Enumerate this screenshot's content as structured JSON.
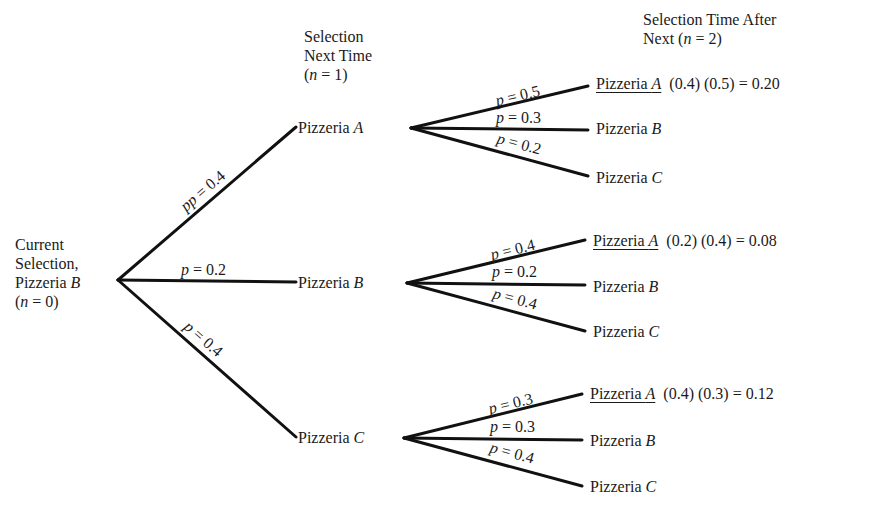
{
  "headers": {
    "current": {
      "line1": "Current",
      "line2": "Selection,",
      "line3_prefix": "Pizzeria ",
      "line3_var": "B",
      "line4": "(n = 0)"
    },
    "level1": {
      "line1": "Selection",
      "line2": "Next Time",
      "line3": "(n = 1)"
    },
    "level2": {
      "line1": "Selection Time After",
      "line2": "Next (n = 2)"
    }
  },
  "root": {
    "label": "Current Selection, Pizzeria B",
    "n": 0
  },
  "level1_branches": [
    {
      "prob_label": "p = 0.4",
      "node_prefix": "Pizzeria ",
      "node_var": "A"
    },
    {
      "prob_label": "p = 0.2",
      "node_prefix": "Pizzeria ",
      "node_var": "B"
    },
    {
      "prob_label": "p = 0.4",
      "node_prefix": "Pizzeria ",
      "node_var": "C"
    }
  ],
  "level2_groups": [
    {
      "parent": "Pizzeria A",
      "branches": [
        {
          "prob_label": "p = 0.5",
          "node_prefix": "Pizzeria ",
          "node_var": "A",
          "calc": "(0.4) (0.5) = 0.20"
        },
        {
          "prob_label": "p = 0.3",
          "node_prefix": "Pizzeria ",
          "node_var": "B",
          "calc": ""
        },
        {
          "prob_label": "p = 0.2",
          "node_prefix": "Pizzeria ",
          "node_var": "C",
          "calc": ""
        }
      ]
    },
    {
      "parent": "Pizzeria B",
      "branches": [
        {
          "prob_label": "p = 0.4",
          "node_prefix": "Pizzeria ",
          "node_var": "A",
          "calc": "(0.2) (0.4) = 0.08"
        },
        {
          "prob_label": "p = 0.2",
          "node_prefix": "Pizzeria ",
          "node_var": "B",
          "calc": ""
        },
        {
          "prob_label": "p = 0.4",
          "node_prefix": "Pizzeria ",
          "node_var": "C",
          "calc": ""
        }
      ]
    },
    {
      "parent": "Pizzeria C",
      "branches": [
        {
          "prob_label": "p = 0.3",
          "node_prefix": "Pizzeria ",
          "node_var": "A",
          "calc": "(0.4) (0.3) = 0.12"
        },
        {
          "prob_label": "p = 0.3",
          "node_prefix": "Pizzeria ",
          "node_var": "B",
          "calc": ""
        },
        {
          "prob_label": "p = 0.4",
          "node_prefix": "Pizzeria ",
          "node_var": "C",
          "calc": ""
        }
      ]
    }
  ],
  "colors": {
    "ink": "#111111",
    "background": "#ffffff"
  }
}
